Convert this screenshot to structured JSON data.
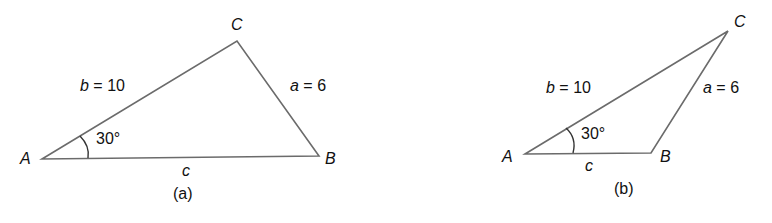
{
  "figures": [
    {
      "id": "a",
      "caption": "(a)",
      "vertices": {
        "A": "A",
        "B": "B",
        "C": "C"
      },
      "side_b": {
        "var": "b",
        "eq": "=",
        "value": "10"
      },
      "side_a": {
        "var": "a",
        "eq": "=",
        "value": "6"
      },
      "side_c": {
        "var": "c"
      },
      "angle_A": "30°"
    },
    {
      "id": "b",
      "caption": "(b)",
      "vertices": {
        "A": "A",
        "B": "B",
        "C": "C"
      },
      "side_b": {
        "var": "b",
        "eq": "=",
        "value": "10"
      },
      "side_a": {
        "var": "a",
        "eq": "=",
        "value": "6"
      },
      "side_c": {
        "var": "c"
      },
      "angle_A": "30°"
    }
  ],
  "colors": {
    "line": "#6b6b6b",
    "text": "#111111",
    "background": "#ffffff"
  }
}
